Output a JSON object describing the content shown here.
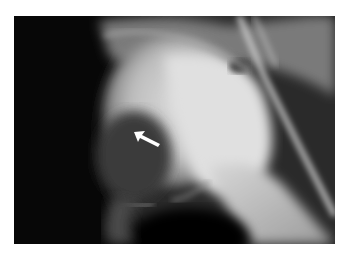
{
  "image": {
    "type": "radiograph",
    "subject": "hip joint X-ray",
    "annotation": {
      "icon": "arrow-icon",
      "direction": "up-left",
      "color": "#ffffff"
    },
    "colors": {
      "page_background": "#ffffff",
      "film_background": "#060606",
      "bone_highlight": "#e6e6e6"
    }
  }
}
